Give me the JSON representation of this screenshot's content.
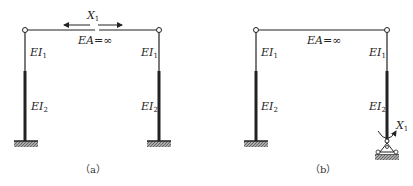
{
  "figure_a": {
    "caption": "（a）",
    "unknown_label": "X",
    "unknown_sub": "1",
    "beam_label": "EA=∞",
    "left_upper": {
      "base": "EI",
      "sub": "1"
    },
    "right_upper": {
      "base": "EI",
      "sub": "1"
    },
    "left_lower": {
      "base": "EI",
      "sub": "2"
    },
    "right_lower": {
      "base": "EI",
      "sub": "2"
    }
  },
  "figure_b": {
    "caption": "（b）",
    "unknown_label": "X",
    "unknown_sub": "1",
    "beam_label": "EA=∞",
    "left_upper": {
      "base": "EI",
      "sub": "1"
    },
    "right_upper": {
      "base": "EI",
      "sub": "1"
    },
    "left_lower": {
      "base": "EI",
      "sub": "2"
    },
    "right_lower": {
      "base": "EI",
      "sub": "2"
    }
  },
  "colors": {
    "line": "#222222",
    "ground": "#888888"
  }
}
